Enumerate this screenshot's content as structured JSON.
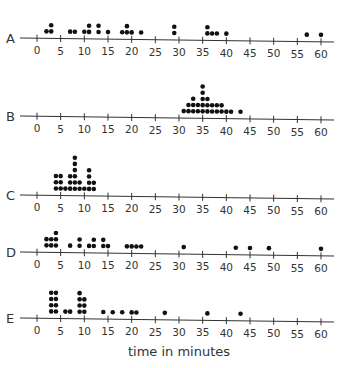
{
  "chart_data": {
    "type": "dot-plot",
    "title": "",
    "xlabel": "time in minutes",
    "ylabel": "",
    "xlim": [
      0,
      60
    ],
    "tick_step": 5,
    "tick_labels": [
      "0",
      "5",
      "10",
      "15",
      "20",
      "25",
      "30",
      "35",
      "40",
      "45",
      "50",
      "55",
      "60"
    ],
    "grid": false,
    "legend": null,
    "series": [
      {
        "name": "A",
        "values": [
          2,
          3,
          3,
          7,
          8,
          10,
          11,
          11,
          13,
          13,
          15,
          18,
          19,
          19,
          20,
          22,
          29,
          29,
          36,
          36,
          37,
          38,
          40,
          57,
          60
        ]
      },
      {
        "name": "B",
        "values": [
          31,
          32,
          32,
          33,
          33,
          33,
          34,
          34,
          35,
          35,
          35,
          35,
          35,
          36,
          36,
          36,
          37,
          37,
          38,
          38,
          39,
          39,
          40,
          41,
          43
        ]
      },
      {
        "name": "C",
        "values": [
          4,
          4,
          4,
          5,
          5,
          5,
          6,
          7,
          7,
          7,
          8,
          8,
          8,
          8,
          8,
          8,
          9,
          9,
          10,
          11,
          11,
          11,
          11,
          12,
          12
        ]
      },
      {
        "name": "D",
        "values": [
          2,
          2,
          3,
          3,
          4,
          4,
          4,
          7,
          9,
          9,
          11,
          12,
          12,
          14,
          14,
          15,
          19,
          20,
          21,
          22,
          31,
          42,
          45,
          49,
          60
        ]
      },
      {
        "name": "E",
        "values": [
          3,
          3,
          3,
          3,
          4,
          4,
          4,
          4,
          6,
          7,
          9,
          9,
          9,
          9,
          10,
          10,
          10,
          14,
          16,
          18,
          20,
          21,
          27,
          36,
          43
        ]
      }
    ]
  },
  "colors": {
    "axis": "#333333",
    "dot": "#111111",
    "text": "#333333"
  }
}
